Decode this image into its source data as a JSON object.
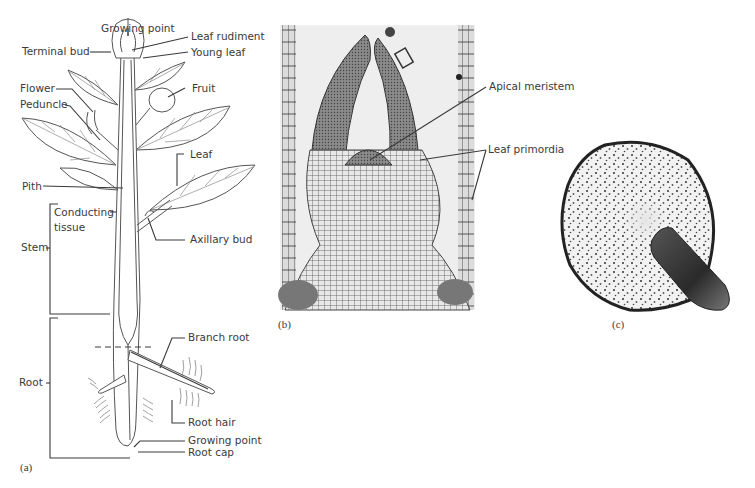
{
  "figure": {
    "panels": [
      {
        "id": "a",
        "caption": "(a)",
        "type": "line-drawing",
        "subject": "whole plant diagram",
        "labels": {
          "growing_point_top": "Growing point",
          "leaf_rudiment": "Leaf rudiment",
          "terminal_bud": "Terminal bud",
          "young_leaf": "Young leaf",
          "flower": "Flower",
          "fruit": "Fruit",
          "peduncle": "Peduncle",
          "leaf": "Leaf",
          "pith": "Pith",
          "conducting_tissue_1": "Conducting",
          "conducting_tissue_2": "tissue",
          "axillary_bud": "Axillary bud",
          "stem": "Stem",
          "branch_root": "Branch root",
          "root": "Root",
          "root_hair": "Root hair",
          "growing_point_root": "Growing point",
          "root_cap": "Root cap"
        }
      },
      {
        "id": "b",
        "caption": "(b)",
        "type": "micrograph",
        "subject": "shoot apex longitudinal section",
        "labels": {
          "apical_meristem": "Apical meristem",
          "leaf_primordia": "Leaf primordia"
        }
      },
      {
        "id": "c",
        "caption": "(c)",
        "type": "micrograph",
        "subject": "stem/root cross section with emerging branch"
      }
    ]
  }
}
